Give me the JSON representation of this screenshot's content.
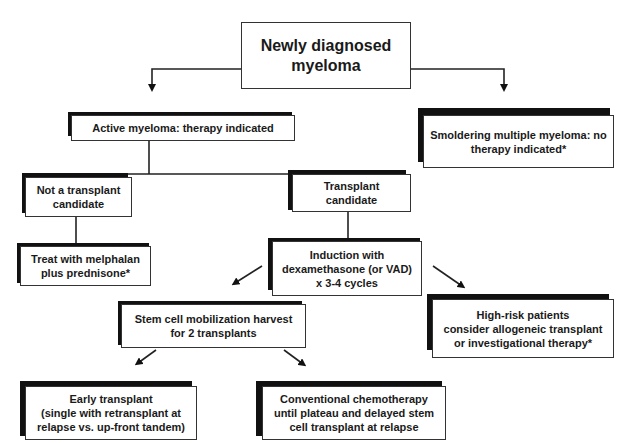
{
  "diagram": {
    "nodes": {
      "root": "Newly diagnosed\nmyeloma",
      "active": "Active myeloma:  therapy indicated",
      "smoldering": "Smoldering multiple myeloma: no\ntherapy indicated*",
      "not_candidate": "Not a transplant\ncandidate",
      "candidate": "Transplant\ncandidate",
      "melphalan": "Treat with melphalan\nplus prednisone*",
      "induction": "Induction with\ndexamethasone (or VAD)\nx 3-4 cycles",
      "stem_cell": "Stem cell mobilization harvest\nfor 2 transplants",
      "high_risk": "High-risk patients\nconsider allogeneic transplant\nor investigational therapy*",
      "early_transplant": "Early transplant\n(single with retransplant at\nrelapse  vs. up-front tandem)",
      "conventional": "Conventional chemotherapy\nuntil plateau and delayed stem\ncell transplant at relapse"
    },
    "edges": [
      {
        "from": "root",
        "to": "active"
      },
      {
        "from": "root",
        "to": "smoldering"
      },
      {
        "from": "active",
        "to": "not_candidate"
      },
      {
        "from": "active",
        "to": "candidate"
      },
      {
        "from": "not_candidate",
        "to": "melphalan"
      },
      {
        "from": "candidate",
        "to": "induction"
      },
      {
        "from": "induction",
        "to": "stem_cell"
      },
      {
        "from": "induction",
        "to": "high_risk"
      },
      {
        "from": "stem_cell",
        "to": "early_transplant"
      },
      {
        "from": "stem_cell",
        "to": "conventional"
      }
    ]
  }
}
